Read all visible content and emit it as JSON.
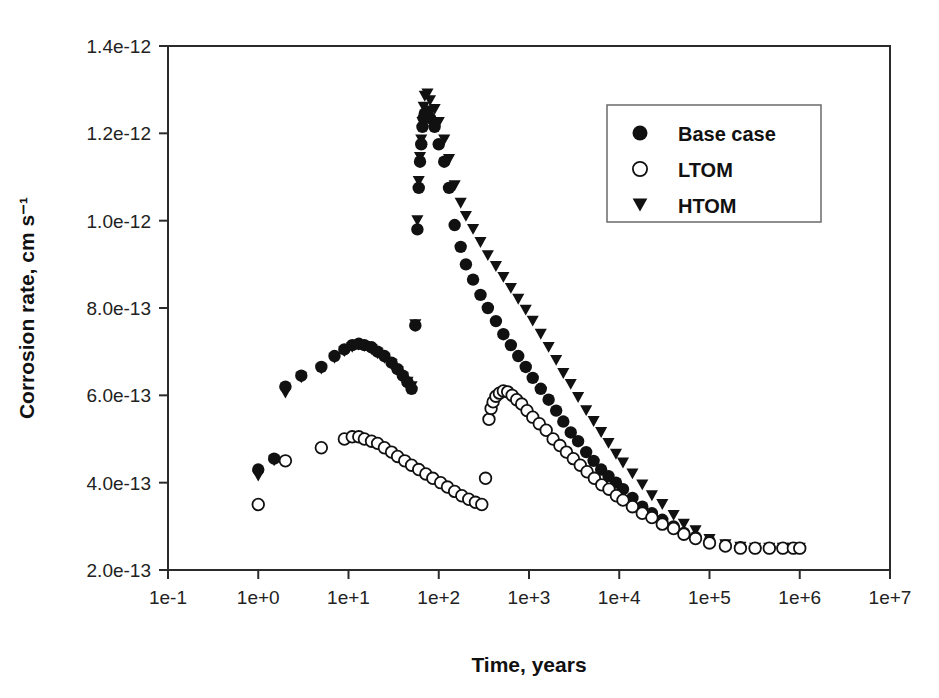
{
  "figure": {
    "background_color": "#ffffff",
    "foreground_color": "#111111"
  },
  "chart_data": {
    "type": "scatter",
    "title": "",
    "xlabel": "Time, years",
    "ylabel": "Corrosion rate, cm s⁻¹",
    "xscale": "log",
    "yscale": "linear",
    "xlim": [
      0.1,
      10000000
    ],
    "ylim": [
      2e-13,
      1.4e-12
    ],
    "xticks": [
      0.1,
      1,
      10,
      100,
      1000,
      10000,
      100000,
      1000000,
      10000000
    ],
    "xticklabels": [
      "1e-1",
      "1e+0",
      "1e+1",
      "1e+2",
      "1e+3",
      "1e+4",
      "1e+5",
      "1e+6",
      "1e+7"
    ],
    "yticks": [
      2e-13,
      4e-13,
      6e-13,
      8e-13,
      1e-12,
      1.2e-12,
      1.4e-12
    ],
    "yticklabels": [
      "2.0e-13",
      "4.0e-13",
      "6.0e-13",
      "8.0e-13",
      "1.0e-12",
      "1.2e-12",
      "1.4e-12"
    ],
    "grid": false,
    "legend_position": "upper right",
    "series": [
      {
        "name": "Base case",
        "marker": "filled-circle",
        "color": "#111111",
        "points": [
          [
            1.0,
            4.3e-13
          ],
          [
            1.5,
            4.55e-13
          ],
          [
            2.0,
            6.2e-13
          ],
          [
            3.0,
            6.45e-13
          ],
          [
            5.0,
            6.65e-13
          ],
          [
            7.0,
            6.9e-13
          ],
          [
            9.0,
            7.05e-13
          ],
          [
            11.0,
            7.15e-13
          ],
          [
            13.0,
            7.18e-13
          ],
          [
            15.0,
            7.15e-13
          ],
          [
            18.0,
            7.1e-13
          ],
          [
            21.0,
            7e-13
          ],
          [
            25.0,
            6.9e-13
          ],
          [
            30.0,
            6.75e-13
          ],
          [
            35.0,
            6.6e-13
          ],
          [
            40.0,
            6.45e-13
          ],
          [
            45.0,
            6.3e-13
          ],
          [
            50.0,
            6.15e-13
          ],
          [
            55.0,
            7.6e-13
          ],
          [
            58.0,
            9.8e-13
          ],
          [
            60.0,
            1.075e-12
          ],
          [
            62.0,
            1.135e-12
          ],
          [
            64.0,
            1.175e-12
          ],
          [
            66.0,
            1.215e-12
          ],
          [
            68.0,
            1.235e-12
          ],
          [
            70.0,
            1.245e-12
          ],
          [
            75.0,
            1.25e-12
          ],
          [
            80.0,
            1.235e-12
          ],
          [
            90.0,
            1.215e-12
          ],
          [
            100.0,
            1.175e-12
          ],
          [
            115.0,
            1.135e-12
          ],
          [
            130.0,
            1.075e-12
          ],
          [
            150.0,
            9.9e-13
          ],
          [
            175.0,
            9.4e-13
          ],
          [
            200.0,
            9e-13
          ],
          [
            240.0,
            8.65e-13
          ],
          [
            290.0,
            8.3e-13
          ],
          [
            350.0,
            8e-13
          ],
          [
            430.0,
            7.7e-13
          ],
          [
            520.0,
            7.4e-13
          ],
          [
            630.0,
            7.15e-13
          ],
          [
            760.0,
            6.9e-13
          ],
          [
            920.0,
            6.65e-13
          ],
          [
            1100.0,
            6.4e-13
          ],
          [
            1350.0,
            6.15e-13
          ],
          [
            1650.0,
            5.9e-13
          ],
          [
            2000.0,
            5.65e-13
          ],
          [
            2400.0,
            5.4e-13
          ],
          [
            2900.0,
            5.15e-13
          ],
          [
            3500.0,
            4.95e-13
          ],
          [
            4300.0,
            4.7e-13
          ],
          [
            5200.0,
            4.5e-13
          ],
          [
            6300.0,
            4.3e-13
          ],
          [
            7600.0,
            4.15e-13
          ],
          [
            9200.0,
            4e-13
          ],
          [
            11000.0,
            3.85e-13
          ],
          [
            14000.0,
            3.65e-13
          ],
          [
            18000.0,
            3.45e-13
          ],
          [
            23000.0,
            3.3e-13
          ],
          [
            30000.0,
            3.15e-13
          ],
          [
            40000.0,
            3e-13
          ],
          [
            52000.0,
            2.85e-13
          ],
          [
            70000.0,
            2.75e-13
          ],
          [
            100000.0,
            2.65e-13
          ],
          [
            150000.0,
            2.55e-13
          ],
          [
            220000.0,
            2.52e-13
          ],
          [
            320000.0,
            2.5e-13
          ],
          [
            460000.0,
            2.5e-13
          ],
          [
            650000.0,
            2.5e-13
          ],
          [
            850000.0,
            2.5e-13
          ],
          [
            1000000.0,
            2.5e-13
          ]
        ]
      },
      {
        "name": "LTOM",
        "marker": "open-circle",
        "color": "#111111",
        "points": [
          [
            1.0,
            3.5e-13
          ],
          [
            2.0,
            4.5e-13
          ],
          [
            5.0,
            4.8e-13
          ],
          [
            9.0,
            5e-13
          ],
          [
            11.0,
            5.05e-13
          ],
          [
            13.0,
            5.05e-13
          ],
          [
            15.0,
            5e-13
          ],
          [
            18.0,
            4.95e-13
          ],
          [
            21.0,
            4.9e-13
          ],
          [
            25.0,
            4.8e-13
          ],
          [
            30.0,
            4.7e-13
          ],
          [
            35.0,
            4.6e-13
          ],
          [
            42.0,
            4.5e-13
          ],
          [
            50.0,
            4.4e-13
          ],
          [
            60.0,
            4.3e-13
          ],
          [
            72.0,
            4.2e-13
          ],
          [
            86.0,
            4.1e-13
          ],
          [
            105.0,
            4e-13
          ],
          [
            125.0,
            3.9e-13
          ],
          [
            150.0,
            3.8e-13
          ],
          [
            180.0,
            3.7e-13
          ],
          [
            215.0,
            3.62e-13
          ],
          [
            255.0,
            3.55e-13
          ],
          [
            300.0,
            3.5e-13
          ],
          [
            330.0,
            4.1e-13
          ],
          [
            360.0,
            5.45e-13
          ],
          [
            380.0,
            5.7e-13
          ],
          [
            400.0,
            5.85e-13
          ],
          [
            430.0,
            5.98e-13
          ],
          [
            470.0,
            6.05e-13
          ],
          [
            520.0,
            6.1e-13
          ],
          [
            580.0,
            6.08e-13
          ],
          [
            650.0,
            6e-13
          ],
          [
            730.0,
            5.9e-13
          ],
          [
            830.0,
            5.8e-13
          ],
          [
            950.0,
            5.65e-13
          ],
          [
            1100.0,
            5.5e-13
          ],
          [
            1300.0,
            5.35e-13
          ],
          [
            1550.0,
            5.2e-13
          ],
          [
            1850.0,
            5e-13
          ],
          [
            2200.0,
            4.85e-13
          ],
          [
            2600.0,
            4.7e-13
          ],
          [
            3100.0,
            4.55e-13
          ],
          [
            3700.0,
            4.4e-13
          ],
          [
            4400.0,
            4.25e-13
          ],
          [
            5300.0,
            4.1e-13
          ],
          [
            6400.0,
            3.95e-13
          ],
          [
            7700.0,
            3.85e-13
          ],
          [
            9300.0,
            3.7e-13
          ],
          [
            11000.0,
            3.6e-13
          ],
          [
            14000.0,
            3.45e-13
          ],
          [
            18000.0,
            3.3e-13
          ],
          [
            23000.0,
            3.2e-13
          ],
          [
            30000.0,
            3.05e-13
          ],
          [
            40000.0,
            2.95e-13
          ],
          [
            52000.0,
            2.82e-13
          ],
          [
            70000.0,
            2.72e-13
          ],
          [
            100000.0,
            2.62e-13
          ],
          [
            150000.0,
            2.55e-13
          ],
          [
            220000.0,
            2.5e-13
          ],
          [
            320000.0,
            2.5e-13
          ],
          [
            460000.0,
            2.5e-13
          ],
          [
            650000.0,
            2.5e-13
          ],
          [
            850000.0,
            2.5e-13
          ],
          [
            1000000.0,
            2.5e-13
          ]
        ]
      },
      {
        "name": "HTOM",
        "marker": "triangle-down",
        "color": "#111111",
        "points": [
          [
            1.0,
            4.15e-13
          ],
          [
            1.5,
            4.5e-13
          ],
          [
            2.0,
            6.05e-13
          ],
          [
            3.0,
            6.4e-13
          ],
          [
            5.0,
            6.6e-13
          ],
          [
            7.0,
            6.85e-13
          ],
          [
            9.0,
            7e-13
          ],
          [
            11.0,
            7.1e-13
          ],
          [
            13.0,
            7.15e-13
          ],
          [
            15.0,
            7.12e-13
          ],
          [
            18.0,
            7.05e-13
          ],
          [
            21.0,
            6.95e-13
          ],
          [
            25.0,
            6.85e-13
          ],
          [
            30.0,
            6.7e-13
          ],
          [
            35.0,
            6.55e-13
          ],
          [
            40.0,
            6.4e-13
          ],
          [
            45.0,
            6.3e-13
          ],
          [
            50.0,
            6.2e-13
          ],
          [
            55.0,
            7.62e-13
          ],
          [
            58.0,
            1e-12
          ],
          [
            60.0,
            1.09e-12
          ],
          [
            62.0,
            1.145e-12
          ],
          [
            64.0,
            1.185e-12
          ],
          [
            66.0,
            1.225e-12
          ],
          [
            68.0,
            1.26e-12
          ],
          [
            70.0,
            1.285e-12
          ],
          [
            75.0,
            1.29e-12
          ],
          [
            80.0,
            1.275e-12
          ],
          [
            90.0,
            1.255e-12
          ],
          [
            100.0,
            1.225e-12
          ],
          [
            115.0,
            1.185e-12
          ],
          [
            130.0,
            1.14e-12
          ],
          [
            150.0,
            1.08e-12
          ],
          [
            175.0,
            1.04e-12
          ],
          [
            200.0,
            1.01e-12
          ],
          [
            240.0,
            9.8e-13
          ],
          [
            290.0,
            9.5e-13
          ],
          [
            350.0,
            9.2e-13
          ],
          [
            430.0,
            8.95e-13
          ],
          [
            520.0,
            8.7e-13
          ],
          [
            630.0,
            8.45e-13
          ],
          [
            760.0,
            8.2e-13
          ],
          [
            920.0,
            7.95e-13
          ],
          [
            1100.0,
            7.7e-13
          ],
          [
            1350.0,
            7.4e-13
          ],
          [
            1650.0,
            7.1e-13
          ],
          [
            2000.0,
            6.8e-13
          ],
          [
            2400.0,
            6.5e-13
          ],
          [
            2900.0,
            6.25e-13
          ],
          [
            3500.0,
            5.95e-13
          ],
          [
            4300.0,
            5.65e-13
          ],
          [
            5200.0,
            5.4e-13
          ],
          [
            6300.0,
            5.15e-13
          ],
          [
            7600.0,
            4.9e-13
          ],
          [
            9200.0,
            4.65e-13
          ],
          [
            11000.0,
            4.45e-13
          ],
          [
            14000.0,
            4.2e-13
          ],
          [
            18000.0,
            3.95e-13
          ],
          [
            23000.0,
            3.7e-13
          ],
          [
            30000.0,
            3.5e-13
          ],
          [
            40000.0,
            3.25e-13
          ],
          [
            52000.0,
            3.05e-13
          ],
          [
            70000.0,
            2.9e-13
          ],
          [
            100000.0,
            2.7e-13
          ],
          [
            150000.0,
            2.58e-13
          ],
          [
            220000.0,
            2.52e-13
          ],
          [
            320000.0,
            2.5e-13
          ],
          [
            460000.0,
            2.5e-13
          ],
          [
            650000.0,
            2.5e-13
          ],
          [
            850000.0,
            2.5e-13
          ],
          [
            1000000.0,
            2.5e-13
          ]
        ]
      }
    ]
  },
  "legend": {
    "items": [
      {
        "label": "Base case",
        "marker": "filled-circle"
      },
      {
        "label": "LTOM",
        "marker": "open-circle"
      },
      {
        "label": "HTOM",
        "marker": "triangle-down"
      }
    ]
  }
}
